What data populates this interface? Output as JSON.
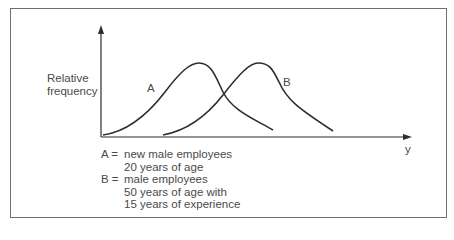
{
  "figure": {
    "y_axis_label": [
      "Relative",
      "frequency"
    ],
    "x_axis_label": "y",
    "curves": [
      {
        "id": "A",
        "label": "A"
      },
      {
        "id": "B",
        "label": "B"
      }
    ],
    "legend": [
      {
        "key": "A =",
        "lines": [
          "new male employees",
          "20 years of age"
        ]
      },
      {
        "key": "B =",
        "lines": [
          "male employees",
          "50 years of age with",
          "15 years of experience"
        ]
      }
    ],
    "colors": {
      "line": "#2e2e2e",
      "frame": "#6e6e6e",
      "text": "#4a4a4a"
    }
  }
}
